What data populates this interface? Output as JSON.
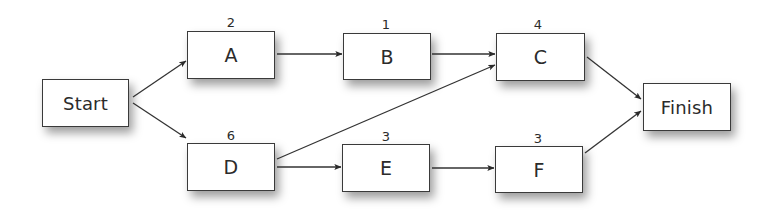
{
  "diagram": {
    "type": "activity-network",
    "colors": {
      "line": "#333333",
      "border": "#3a3a3a",
      "text": "#2b2b2b",
      "background": "#ffffff"
    },
    "nodes": {
      "start": {
        "label": "Start"
      },
      "a": {
        "label": "A",
        "duration": "2"
      },
      "b": {
        "label": "B",
        "duration": "1"
      },
      "c": {
        "label": "C",
        "duration": "4"
      },
      "d": {
        "label": "D",
        "duration": "6"
      },
      "e": {
        "label": "E",
        "duration": "3"
      },
      "f": {
        "label": "F",
        "duration": "3"
      },
      "finish": {
        "label": "Finish"
      }
    },
    "edges": [
      {
        "from": "Start",
        "to": "A"
      },
      {
        "from": "Start",
        "to": "D"
      },
      {
        "from": "A",
        "to": "B"
      },
      {
        "from": "B",
        "to": "C"
      },
      {
        "from": "D",
        "to": "C"
      },
      {
        "from": "D",
        "to": "E"
      },
      {
        "from": "E",
        "to": "F"
      },
      {
        "from": "C",
        "to": "Finish"
      },
      {
        "from": "F",
        "to": "Finish"
      }
    ]
  }
}
